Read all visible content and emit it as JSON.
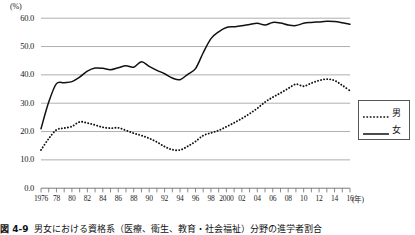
{
  "chart_data": {
    "type": "line",
    "title": "",
    "xlabel": "(年)",
    "ylabel": "(%)",
    "ylim": [
      0.0,
      60.0
    ],
    "ytick_labels": [
      "60.0",
      "50.0",
      "40.0",
      "30.0",
      "20.0",
      "10.0",
      "0.0"
    ],
    "ytick_values": [
      60.0,
      50.0,
      40.0,
      30.0,
      20.0,
      10.0,
      0.0
    ],
    "grid": true,
    "grid_axis": "y",
    "legend_position": "right-middle",
    "x": [
      1976,
      1977,
      1978,
      1979,
      1980,
      1981,
      1982,
      1983,
      1984,
      1985,
      1986,
      1987,
      1988,
      1989,
      1990,
      1991,
      1992,
      1993,
      1994,
      1995,
      1996,
      1997,
      1998,
      1999,
      2000,
      2001,
      2002,
      2003,
      2004,
      2005,
      2006,
      2007,
      2008,
      2009,
      2010,
      2011,
      2012,
      2013,
      2014,
      2015,
      2016
    ],
    "xtick_labels": [
      "1976",
      "78",
      "80",
      "82",
      "84",
      "86",
      "88",
      "90",
      "92",
      "94",
      "96",
      "98",
      "2000",
      "02",
      "04",
      "06",
      "08",
      "10",
      "12",
      "14",
      "16"
    ],
    "xtick_values": [
      1976,
      1978,
      1980,
      1982,
      1984,
      1986,
      1988,
      1990,
      1992,
      1994,
      1996,
      1998,
      2000,
      2002,
      2004,
      2006,
      2008,
      2010,
      2012,
      2014,
      2016
    ],
    "series": [
      {
        "name": "男",
        "style": "dotted",
        "color": "#111111",
        "values": [
          13.5,
          17.5,
          20.6,
          21.2,
          21.8,
          23.4,
          23.0,
          22.3,
          21.5,
          21.2,
          21.3,
          20.4,
          19.4,
          18.6,
          17.6,
          16.3,
          14.7,
          13.6,
          13.5,
          14.8,
          16.5,
          18.6,
          19.5,
          20.4,
          21.7,
          23.1,
          24.6,
          26.3,
          28.2,
          30.4,
          32.1,
          33.6,
          35.2,
          36.7,
          36.0,
          37.1,
          38.0,
          38.5,
          38.0,
          36.3,
          34.4
        ]
      },
      {
        "name": "女",
        "style": "solid",
        "color": "#111111",
        "values": [
          21.0,
          30.4,
          36.9,
          37.2,
          37.6,
          39.2,
          41.3,
          42.4,
          42.3,
          41.8,
          42.5,
          43.2,
          42.7,
          44.6,
          43.0,
          41.6,
          40.4,
          38.9,
          38.3,
          40.2,
          42.2,
          47.8,
          52.8,
          55.2,
          56.7,
          57.0,
          57.3,
          57.8,
          58.2,
          57.6,
          58.5,
          58.3,
          57.6,
          57.4,
          58.2,
          58.5,
          58.7,
          58.9,
          58.8,
          58.4,
          57.9
        ]
      }
    ]
  },
  "legend": {
    "items": [
      {
        "label": "男",
        "style": "dotted"
      },
      {
        "label": "女",
        "style": "solid"
      }
    ]
  },
  "caption": {
    "number": "図 4-9",
    "text": "男女における資格系（医療、衛生、教育・社会福祉）分野の進学者割合"
  }
}
